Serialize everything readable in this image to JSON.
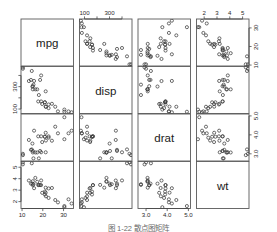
{
  "figure": {
    "kind": "scatterplot-matrix",
    "variable_count": 4,
    "marker_symbol": "open-circle",
    "marker_color": "#3c3c3c",
    "frame_color": "#5a5a5a",
    "background_color": "#ffffff",
    "caption": "图 1-22   散点图矩阵"
  },
  "chart_data": {
    "type": "scatter",
    "title": "",
    "subtitle": "",
    "xlabel": "",
    "ylabel": "",
    "grid": false,
    "legend_position": "none",
    "matrix": true,
    "variables": [
      {
        "name": "mpg",
        "axis_label": "mpg",
        "ticks": [
          10,
          20,
          30
        ],
        "tick_labels": [
          "10",
          "20",
          "30"
        ],
        "range": [
          9.5,
          34.8
        ],
        "bottom_axis": true,
        "right_axis": true
      },
      {
        "name": "disp",
        "axis_label": "disp",
        "ticks": [
          100,
          300
        ],
        "tick_labels": [
          "100",
          "300"
        ],
        "minor_ticks": [
          100,
          200,
          300,
          400
        ],
        "range": [
          60,
          480
        ],
        "top_axis": true,
        "left_axis": true
      },
      {
        "name": "drat",
        "axis_label": "drat",
        "ticks": [
          3.0,
          4.0,
          5.0
        ],
        "tick_labels": [
          "3.0",
          "4.0",
          "5.0"
        ],
        "range": [
          2.62,
          5.1
        ],
        "bottom_axis": true,
        "right_axis": true
      },
      {
        "name": "wt",
        "axis_label": "wt",
        "ticks": [
          2,
          3,
          4,
          5
        ],
        "tick_labels": [
          "2",
          "3",
          "4",
          "5"
        ],
        "range": [
          1.4,
          5.5
        ],
        "top_axis": true,
        "left_axis": true
      }
    ],
    "observations": [
      {
        "mpg": 21.0,
        "disp": 160.0,
        "drat": 3.9,
        "wt": 2.62
      },
      {
        "mpg": 21.0,
        "disp": 160.0,
        "drat": 3.9,
        "wt": 2.875
      },
      {
        "mpg": 22.8,
        "disp": 108.0,
        "drat": 3.85,
        "wt": 2.32
      },
      {
        "mpg": 21.4,
        "disp": 258.0,
        "drat": 3.08,
        "wt": 3.215
      },
      {
        "mpg": 18.7,
        "disp": 360.0,
        "drat": 3.15,
        "wt": 3.44
      },
      {
        "mpg": 18.1,
        "disp": 225.0,
        "drat": 2.76,
        "wt": 3.46
      },
      {
        "mpg": 14.3,
        "disp": 360.0,
        "drat": 3.21,
        "wt": 3.57
      },
      {
        "mpg": 24.4,
        "disp": 146.7,
        "drat": 3.69,
        "wt": 3.19
      },
      {
        "mpg": 22.8,
        "disp": 140.8,
        "drat": 3.92,
        "wt": 3.15
      },
      {
        "mpg": 19.2,
        "disp": 167.6,
        "drat": 3.92,
        "wt": 3.44
      },
      {
        "mpg": 17.8,
        "disp": 167.6,
        "drat": 3.92,
        "wt": 3.44
      },
      {
        "mpg": 16.4,
        "disp": 275.8,
        "drat": 3.07,
        "wt": 4.07
      },
      {
        "mpg": 17.3,
        "disp": 275.8,
        "drat": 3.07,
        "wt": 3.73
      },
      {
        "mpg": 15.2,
        "disp": 275.8,
        "drat": 3.07,
        "wt": 3.78
      },
      {
        "mpg": 10.4,
        "disp": 472.0,
        "drat": 2.93,
        "wt": 5.25
      },
      {
        "mpg": 10.4,
        "disp": 460.0,
        "drat": 3.0,
        "wt": 5.424
      },
      {
        "mpg": 14.7,
        "disp": 440.0,
        "drat": 3.23,
        "wt": 5.345
      },
      {
        "mpg": 32.4,
        "disp": 78.7,
        "drat": 4.08,
        "wt": 2.2
      },
      {
        "mpg": 30.4,
        "disp": 75.7,
        "drat": 4.93,
        "wt": 1.615
      },
      {
        "mpg": 33.9,
        "disp": 71.1,
        "drat": 4.22,
        "wt": 1.835
      },
      {
        "mpg": 21.5,
        "disp": 120.1,
        "drat": 3.7,
        "wt": 2.465
      },
      {
        "mpg": 15.5,
        "disp": 318.0,
        "drat": 2.76,
        "wt": 3.52
      },
      {
        "mpg": 15.2,
        "disp": 304.0,
        "drat": 3.15,
        "wt": 3.435
      },
      {
        "mpg": 13.3,
        "disp": 350.0,
        "drat": 3.73,
        "wt": 3.84
      },
      {
        "mpg": 19.2,
        "disp": 400.0,
        "drat": 3.08,
        "wt": 3.845
      },
      {
        "mpg": 27.3,
        "disp": 79.0,
        "drat": 4.08,
        "wt": 1.935
      },
      {
        "mpg": 26.0,
        "disp": 120.3,
        "drat": 4.43,
        "wt": 2.14
      },
      {
        "mpg": 30.4,
        "disp": 95.1,
        "drat": 3.77,
        "wt": 1.513
      },
      {
        "mpg": 15.8,
        "disp": 351.0,
        "drat": 4.22,
        "wt": 3.17
      },
      {
        "mpg": 19.7,
        "disp": 145.0,
        "drat": 3.62,
        "wt": 2.77
      },
      {
        "mpg": 15.0,
        "disp": 301.0,
        "drat": 3.54,
        "wt": 3.57
      },
      {
        "mpg": 21.4,
        "disp": 121.0,
        "drat": 4.11,
        "wt": 2.78
      }
    ]
  }
}
